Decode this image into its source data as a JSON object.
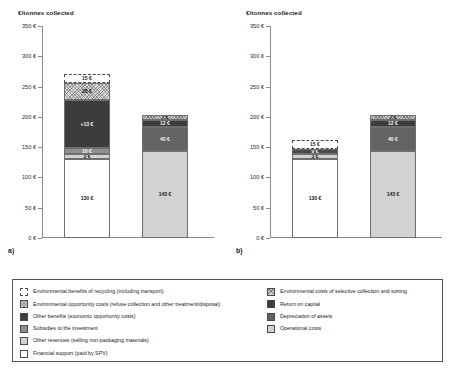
{
  "charts": [
    {
      "letter": "a)",
      "axis_title": "€/tonnes collected",
      "ticks": [
        "350 €",
        "300 €",
        "250 €",
        "200 €",
        "150 €",
        "100 €",
        "50 €",
        "0 €"
      ],
      "bars": [
        {
          "name": "bar-1",
          "segments": [
            {
              "label": "130 €",
              "value": 130,
              "fill": "f-white",
              "text": "lbl-light"
            },
            {
              "label": "3 €",
              "value": 3,
              "fill": "f-lightgray",
              "text": "lbl-light"
            },
            {
              "label": "10 €",
              "value": 10,
              "fill": "f-midgray",
              "text": "lbl-dark"
            },
            {
              "label": "+13 €",
              "value": 113,
              "fill": "f-verydark",
              "text": "lbl-dark"
            },
            {
              "label": "28 €",
              "value": 28,
              "fill": "f-hatch",
              "text": "lbl-light"
            },
            {
              "label": "15 €",
              "value": 15,
              "fill": "seg-dashed",
              "text": "lbl-light"
            }
          ]
        },
        {
          "name": "bar-2",
          "segments": [
            {
              "label": "143 €",
              "value": 143,
              "fill": "f-lightgray",
              "text": "lbl-light"
            },
            {
              "label": "40 €",
              "value": 40,
              "fill": "f-darkgray",
              "text": "lbl-dark"
            },
            {
              "label": "12 €",
              "value": 12,
              "fill": "f-verydark",
              "text": "lbl-dark"
            },
            {
              "label": "7 €",
              "value": 7,
              "fill": "f-hatch2",
              "text": "lbl-light"
            }
          ]
        }
      ]
    },
    {
      "letter": "b)",
      "axis_title": "€/tonnes collected",
      "ticks": [
        "350 €",
        "300 €",
        "250 €",
        "200 €",
        "150 €",
        "100 €",
        "50 €",
        "0 €"
      ],
      "bars": [
        {
          "name": "bar-1",
          "segments": [
            {
              "label": "130 €",
              "value": 130,
              "fill": "f-white",
              "text": "lbl-light"
            },
            {
              "label": "3 €",
              "value": 3,
              "fill": "f-lightgray",
              "text": "lbl-light"
            },
            {
              "label": "9 €",
              "value": 9,
              "fill": "f-dotdark",
              "text": "lbl-dark"
            },
            {
              "label": "15 €",
              "value": 15,
              "fill": "seg-dashed",
              "text": "lbl-light"
            }
          ]
        },
        {
          "name": "bar-2",
          "segments": [
            {
              "label": "143 €",
              "value": 143,
              "fill": "f-lightgray",
              "text": "lbl-light"
            },
            {
              "label": "40 €",
              "value": 40,
              "fill": "f-darkgray",
              "text": "lbl-dark"
            },
            {
              "label": "12 €",
              "value": 12,
              "fill": "f-verydark",
              "text": "lbl-dark"
            },
            {
              "label": "7 €",
              "value": 7,
              "fill": "f-hatch2",
              "text": "lbl-light"
            }
          ]
        }
      ]
    }
  ],
  "legend": {
    "left": [
      {
        "label": "Environmental benefits of recycling (including transport)",
        "swatch": "sw-dashed"
      },
      {
        "label": "Environmental opportunity costs (refuse collection and other treatment/disposal)",
        "swatch": "f-hatch"
      },
      {
        "label": "Other benefits (economic opportunity costs)",
        "swatch": "f-verydark"
      },
      {
        "label": "Subsidies to the investment",
        "swatch": "f-midgray"
      },
      {
        "label": "Other revenues (selling non-packaging materials)",
        "swatch": "f-lightgray"
      },
      {
        "label": "Financial support (paid by SPV)",
        "swatch": "f-white"
      }
    ],
    "right": [
      {
        "label": "Environmental costs of selective collection and sorting",
        "swatch": "f-hatch2"
      },
      {
        "label": "Return on capital",
        "swatch": "f-verydark"
      },
      {
        "label": "Depreciation of assets",
        "swatch": "f-darkgray"
      },
      {
        "label": "Operational costs",
        "swatch": "f-lightgray"
      }
    ]
  },
  "chart_data": {
    "type": "bar",
    "subtype": "stacked",
    "title": "",
    "ylabel": "€/tonnes collected",
    "xlabel": "",
    "ylim": [
      0,
      350
    ],
    "ytick_step": 50,
    "yticks": [
      0,
      50,
      100,
      150,
      200,
      250,
      300,
      350
    ],
    "ytick_labels": [
      "0 €",
      "50 €",
      "100 €",
      "150 €",
      "200 €",
      "250 €",
      "300 €",
      "350 €"
    ],
    "grid": false,
    "legend_position": "bottom",
    "panels": [
      {
        "panel": "a)",
        "bars": [
          {
            "name": "benefits-bar",
            "stack": [
              {
                "series": "Financial support (paid by SPV)",
                "value": 130,
                "label": "130 €"
              },
              {
                "series": "Other revenues (selling non-packaging materials)",
                "value": 3,
                "label": "3 €"
              },
              {
                "series": "Subsidies to the investment",
                "value": 10,
                "label": "10 €"
              },
              {
                "series": "Other benefits (economic opportunity costs)",
                "value": 113,
                "label": "+13 €"
              },
              {
                "series": "Environmental opportunity costs (refuse collection and other treatment/disposal)",
                "value": 28,
                "label": "28 €"
              },
              {
                "series": "Environmental benefits of recycling (including transport)",
                "value": 15,
                "label": "15 €"
              }
            ],
            "total": 299
          },
          {
            "name": "costs-bar",
            "stack": [
              {
                "series": "Operational costs",
                "value": 143,
                "label": "143 €"
              },
              {
                "series": "Depreciation of assets",
                "value": 40,
                "label": "40 €"
              },
              {
                "series": "Return on capital",
                "value": 12,
                "label": "12 €"
              },
              {
                "series": "Environmental costs of selective collection and sorting",
                "value": 7,
                "label": "7 €"
              }
            ],
            "total": 202
          }
        ]
      },
      {
        "panel": "b)",
        "bars": [
          {
            "name": "benefits-bar",
            "stack": [
              {
                "series": "Financial support (paid by SPV)",
                "value": 130,
                "label": "130 €"
              },
              {
                "series": "Other revenues (selling non-packaging materials)",
                "value": 3,
                "label": "3 €"
              },
              {
                "series": "Subsidies to the investment",
                "value": 9,
                "label": "9 €"
              },
              {
                "series": "Environmental benefits of recycling (including transport)",
                "value": 15,
                "label": "15 €"
              }
            ],
            "total": 157
          },
          {
            "name": "costs-bar",
            "stack": [
              {
                "series": "Operational costs",
                "value": 143,
                "label": "143 €"
              },
              {
                "series": "Depreciation of assets",
                "value": 40,
                "label": "40 €"
              },
              {
                "series": "Return on capital",
                "value": 12,
                "label": "12 €"
              },
              {
                "series": "Environmental costs of selective collection and sorting",
                "value": 7,
                "label": "7 €"
              }
            ],
            "total": 202
          }
        ]
      }
    ]
  }
}
